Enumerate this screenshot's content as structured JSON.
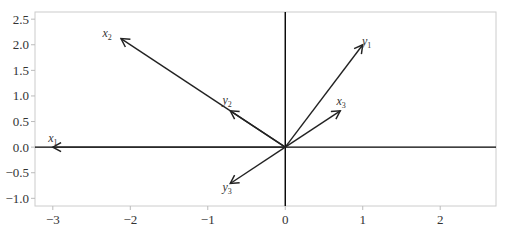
{
  "chart_data": {
    "type": "line",
    "subtype": "vector-plot",
    "title": "",
    "xlabel": "",
    "ylabel": "",
    "xlim": [
      -3.23,
      2.72
    ],
    "ylim": [
      -1.15,
      2.64
    ],
    "grid": false,
    "legend": null,
    "x_ticks": [
      -3,
      -2,
      -1,
      0,
      1,
      2
    ],
    "x_tick_labels": [
      "−3",
      "−2",
      "−1",
      "0",
      "1",
      "2"
    ],
    "y_ticks": [
      -1.0,
      -0.5,
      0.0,
      0.5,
      1.0,
      1.5,
      2.0,
      2.5
    ],
    "y_tick_labels": [
      "−1.0",
      "−0.5",
      "0.0",
      "0.5",
      "1.0",
      "1.5",
      "2.0",
      "2.5"
    ],
    "axes_lines": {
      "x_zero": true,
      "y_zero": true
    },
    "vectors": [
      {
        "name": "x1",
        "base": "x",
        "sub": "1",
        "origin": [
          0,
          0
        ],
        "tip": [
          -3.0,
          0.0
        ],
        "label_pos": [
          -3.0,
          0.1
        ]
      },
      {
        "name": "x2",
        "base": "x",
        "sub": "2",
        "origin": [
          0,
          0
        ],
        "tip": [
          -2.12,
          2.12
        ],
        "label_pos": [
          -2.3,
          2.15
        ]
      },
      {
        "name": "x3",
        "base": "x",
        "sub": "3",
        "origin": [
          0,
          0
        ],
        "tip": [
          0.71,
          0.71
        ],
        "label_pos": [
          0.72,
          0.82
        ]
      },
      {
        "name": "y1",
        "base": "y",
        "sub": "1",
        "origin": [
          0,
          0
        ],
        "tip": [
          1.0,
          2.0
        ],
        "label_pos": [
          1.05,
          2.0
        ]
      },
      {
        "name": "y2",
        "base": "y",
        "sub": "2",
        "origin": [
          0,
          0
        ],
        "tip": [
          -0.71,
          0.71
        ],
        "label_pos": [
          -0.75,
          0.85
        ]
      },
      {
        "name": "y3",
        "base": "y",
        "sub": "3",
        "origin": [
          0,
          0
        ],
        "tip": [
          -0.71,
          -0.71
        ],
        "label_pos": [
          -0.75,
          -0.85
        ]
      }
    ],
    "colors": {
      "vector": "#222222",
      "frame": "#cccccc",
      "axis": "#000000",
      "tick_text": "#333333"
    }
  },
  "layout": {
    "plot_px": {
      "left": 35,
      "top": 12,
      "right": 496,
      "bottom": 206
    }
  }
}
